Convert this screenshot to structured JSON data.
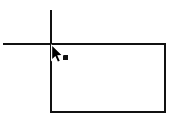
{
  "canvas": {
    "name": "drawing-canvas",
    "width": 174,
    "height": 119,
    "background_color": "#ffffff",
    "stroke_color": "#111111"
  },
  "shapes": {
    "rectangle": {
      "icon_name": "rectangle-shape",
      "x": 51,
      "y": 44,
      "width": 114,
      "height": 68,
      "stroke_width": 2,
      "fill": "none",
      "stroke_color": "#111111"
    },
    "guide_horizontal": {
      "icon_name": "horizontal-guide-line",
      "x1": 3,
      "y1": 44,
      "x2": 51,
      "y2": 44,
      "stroke_width": 2,
      "stroke_color": "#111111"
    },
    "guide_vertical": {
      "icon_name": "vertical-guide-line",
      "x1": 51,
      "y1": 10,
      "x2": 51,
      "y2": 44,
      "stroke_width": 2,
      "stroke_color": "#111111"
    },
    "anchor_dot": {
      "icon_name": "anchor-point-dot",
      "x": 63,
      "y": 55,
      "size": 5,
      "fill": "#111111"
    }
  },
  "cursor": {
    "icon_name": "arrow-cursor",
    "tip_x": 51,
    "tip_y": 44,
    "fill": "#000000",
    "outline": "#ffffff"
  }
}
